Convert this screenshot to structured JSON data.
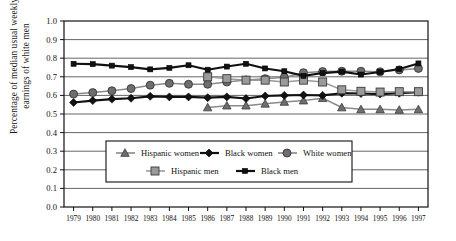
{
  "chart_data": {
    "type": "line",
    "title": "",
    "xlabel": "",
    "ylabel_line1": "Percentage of median usual weekly",
    "ylabel_line2": "earnings of white men",
    "ylim": [
      0.0,
      1.0
    ],
    "ytick_labels": [
      "0.0",
      "0.1",
      "0.2",
      "0.3",
      "0.4",
      "0.5",
      "0.6",
      "0.7",
      "0.8",
      "0.9",
      "1.0"
    ],
    "ytick_values": [
      0.0,
      0.1,
      0.2,
      0.3,
      0.4,
      0.5,
      0.6,
      0.7,
      0.8,
      0.9,
      1.0
    ],
    "grid": true,
    "legend_position": "inside-lower-center",
    "x": [
      1979,
      1980,
      1981,
      1982,
      1983,
      1984,
      1985,
      1986,
      1987,
      1988,
      1989,
      1990,
      1991,
      1992,
      1993,
      1994,
      1995,
      1996,
      1997
    ],
    "xtick_labels": [
      "1979",
      "1980",
      "1981",
      "1982",
      "1983",
      "1984",
      "1985",
      "1986",
      "1987",
      "1988",
      "1989",
      "1990",
      "1991",
      "1992",
      "1993",
      "1994",
      "1995",
      "1996",
      "1997"
    ],
    "series": [
      {
        "name": "Hispanic women",
        "marker": "triangle",
        "color": "#6e6e6e",
        "line_color": "#8a8a8a",
        "values": [
          null,
          null,
          null,
          null,
          null,
          null,
          null,
          0.535,
          0.545,
          0.545,
          0.555,
          0.565,
          0.572,
          0.585,
          0.535,
          0.525,
          0.525,
          0.522,
          0.525
        ]
      },
      {
        "name": "Black women",
        "marker": "diamond",
        "color": "#111111",
        "line_color": "#111111",
        "values": [
          0.562,
          0.572,
          0.58,
          0.585,
          0.595,
          0.592,
          0.592,
          0.588,
          0.592,
          0.583,
          0.597,
          0.6,
          0.602,
          0.6,
          0.612,
          0.61,
          0.607,
          0.612,
          0.617
        ]
      },
      {
        "name": "White women",
        "marker": "circle",
        "color": "#6e6e6e",
        "line_color": "#8a8a8a",
        "values": [
          0.607,
          0.615,
          0.625,
          0.637,
          0.655,
          0.665,
          0.66,
          0.66,
          0.672,
          0.683,
          0.69,
          0.697,
          0.722,
          0.728,
          0.73,
          0.73,
          0.727,
          0.737,
          0.745
        ]
      },
      {
        "name": "Hispanic men",
        "marker": "square",
        "color": "#9a9a9a",
        "line_color": "#9a9a9a",
        "values": [
          null,
          null,
          null,
          null,
          null,
          null,
          null,
          0.7,
          0.69,
          0.682,
          0.682,
          0.672,
          0.682,
          0.672,
          0.63,
          0.622,
          0.618,
          0.62,
          0.62
        ]
      },
      {
        "name": "Black men",
        "marker": "square-small",
        "color": "#111111",
        "line_color": "#111111",
        "values": [
          0.77,
          0.768,
          0.76,
          0.752,
          0.74,
          0.748,
          0.762,
          0.738,
          0.755,
          0.77,
          0.745,
          0.73,
          0.705,
          0.72,
          0.728,
          0.712,
          0.726,
          0.742,
          0.772
        ]
      }
    ]
  }
}
